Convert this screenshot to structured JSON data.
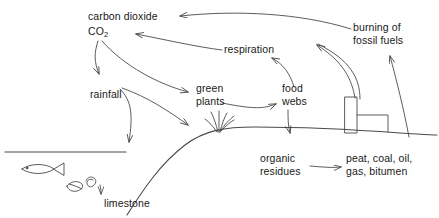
{
  "diagram": {
    "stroke_color": "#4a4a4a",
    "text_color": "#1a1a1a",
    "background": "#ffffff",
    "width": 439,
    "height": 218
  },
  "labels": {
    "carbon_dioxide": "carbon dioxide",
    "co2_formula": "CO",
    "co2_subscript": "2",
    "respiration": "respiration",
    "burning_fossil_fuels_line1": "burning of",
    "burning_fossil_fuels_line2": "fossil fuels",
    "rainfall": "rainfall",
    "green_plants_line1": "green",
    "green_plants_line2": "plants",
    "food_webs_line1": "food",
    "food_webs_line2": "webs",
    "organic_residues_line1": "organic",
    "organic_residues_line2": "residues",
    "fossil_products_line1": "peat, coal, oil,",
    "fossil_products_line2": "gas, bitumen",
    "limestone": "limestone"
  },
  "flows": [
    {
      "from": "burning of fossil fuels",
      "to": "carbon dioxide"
    },
    {
      "from": "respiration",
      "to": "CO2"
    },
    {
      "from": "CO2",
      "to": "rainfall"
    },
    {
      "from": "CO2",
      "to": "green plants"
    },
    {
      "from": "green plants",
      "to": "food webs"
    },
    {
      "from": "food webs",
      "to": "respiration"
    },
    {
      "from": "food webs",
      "to": "organic residues"
    },
    {
      "from": "organic residues",
      "to": "peat, coal, oil, gas, bitumen"
    },
    {
      "from": "rainfall",
      "to": "ground"
    },
    {
      "from": "rainfall",
      "to": "sea"
    },
    {
      "from": "sea shells",
      "to": "limestone"
    },
    {
      "from": "ground deposits",
      "to": "burning of fossil fuels"
    },
    {
      "from": "factory chimney",
      "to": "carbon dioxide"
    }
  ],
  "scene": {
    "fish": "fish",
    "shell": "shell",
    "snail": "snail",
    "grass_tuft": "grass-tuft",
    "factory": "factory-with-chimney",
    "water_surface": "water-surface-line",
    "ground": "ground-line"
  }
}
